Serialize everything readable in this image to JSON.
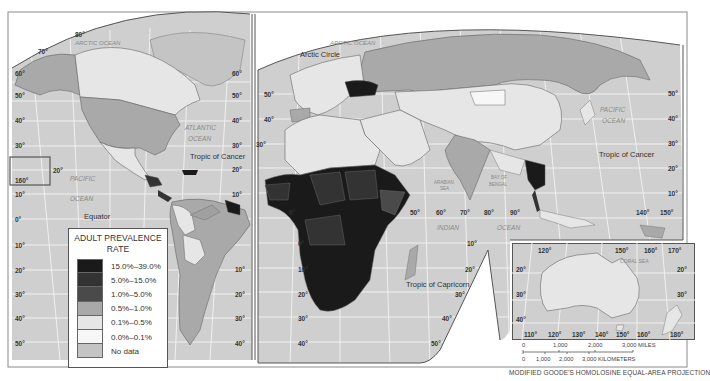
{
  "map": {
    "title": "Adult HIV/AIDS prevalence world map",
    "projection_note": "MODIFIED GOODE'S HOMOLOSINE EQUAL-AREA PROJECTION",
    "colors": {
      "ocean": "#cfcfcf",
      "grid": "#f2f2f2",
      "border": "#555555",
      "frame": "#7a7a7a"
    },
    "labels": {
      "arctic_ocean": "ARCTIC OCEAN",
      "arctic_circle": "Arctic Circle",
      "atlantic_ocean_1": "ATLANTIC",
      "atlantic_ocean_2": "OCEAN",
      "pacific_ocean_w_1": "PACIFIC",
      "pacific_ocean_w_2": "OCEAN",
      "pacific_ocean_e_1": "PACIFIC",
      "pacific_ocean_e_2": "OCEAN",
      "indian_ocean_1": "INDIAN",
      "indian_ocean_2": "OCEAN",
      "arabian_sea_1": "ARABIAN",
      "arabian_sea_2": "SEA",
      "bay_of_bengal_1": "BAY OF",
      "bay_of_bengal_2": "BENGAL",
      "coral_sea": "CORAL SEA",
      "tropic_of_cancer_w": "Tropic of Cancer",
      "tropic_of_cancer_e": "Tropic of Cancer",
      "tropic_of_capricorn": "Tropic of Capricorn",
      "equator": "Equator"
    },
    "lat_ticks_left": [
      "80°",
      "70°",
      "60°",
      "50°",
      "40°",
      "30°",
      "20°",
      "10°",
      "0°",
      "10°",
      "20°",
      "30°",
      "40°",
      "50°"
    ],
    "lat_ticks_west_right": [
      "60°",
      "50°",
      "40°",
      "30°",
      "20°",
      "10°"
    ],
    "lat_ticks_mid": [
      "50°",
      "40°",
      "30°",
      "20°",
      "10°",
      "0°",
      "10°",
      "20°",
      "30°",
      "40°",
      "50°"
    ],
    "lat_ticks_africa_right": [
      "10°",
      "20°",
      "30°",
      "40°",
      "50°"
    ],
    "lat_ticks_east": [
      "50°",
      "40°",
      "30°",
      "20°",
      "10°"
    ],
    "lon_ticks_indian": [
      "0°",
      "50°",
      "60°",
      "70°",
      "80°",
      "90°"
    ],
    "lon_ticks_pacific": [
      "140°",
      "150°"
    ],
    "hawaii_lon": "160°",
    "hawaii_lat": "20°"
  },
  "legend": {
    "title_line1": "ADULT PREVALENCE",
    "title_line2": "RATE",
    "items": [
      {
        "label": "15.0%–39.0%",
        "color": "#1a1a1a"
      },
      {
        "label": "5.0%–15.0%",
        "color": "#333333"
      },
      {
        "label": "1.0%–5.0%",
        "color": "#4a4a4a"
      },
      {
        "label": "0.5%–1.0%",
        "color": "#a9a9a9"
      },
      {
        "label": "0.1%–0.5%",
        "color": "#e6e6e6"
      },
      {
        "label": "0.0%–0.1%",
        "color": "#f7f7f7"
      },
      {
        "label": "No data",
        "color": "#c4c4c4"
      }
    ]
  },
  "inset": {
    "top_lon": [
      "120°",
      "150°",
      "160°",
      "170°"
    ],
    "bottom_lon": [
      "110°",
      "120°",
      "130°",
      "140°",
      "150°",
      "160°",
      "180°"
    ],
    "left_lat": [
      "20°",
      "30°",
      "40°"
    ],
    "right_lat": [
      "20°",
      "30°"
    ],
    "sea_label": "CORAL SEA"
  },
  "scale_bar": {
    "miles": [
      "0",
      "1,000",
      "2,000",
      "3,000 MILES"
    ],
    "kilometers": [
      "0",
      "1,000",
      "2,000",
      "3,000 KILOMETERS"
    ]
  }
}
